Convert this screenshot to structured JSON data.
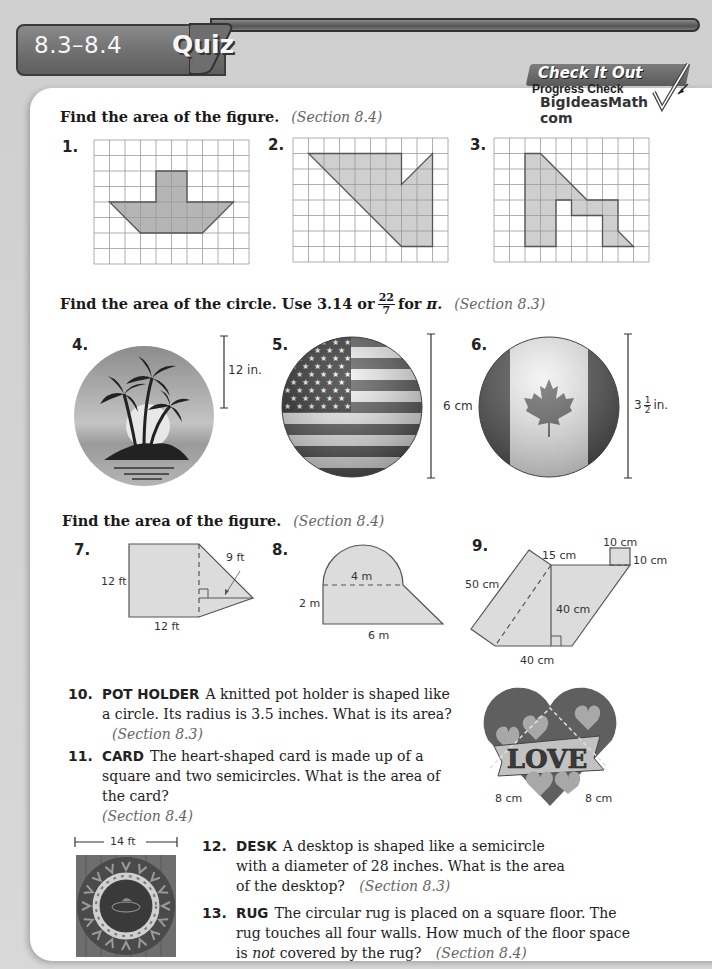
{
  "header": {
    "sections": "8.3–8.4",
    "title": "Quiz"
  },
  "badge": {
    "title": "Check It Out",
    "subtitle": "Progress Check",
    "site": "BigIdeasMath",
    "site_suffix": "com"
  },
  "part1": {
    "instruction": "Find the area of the figure.",
    "section": "(Section 8.4)",
    "figures": [
      {
        "number": "1.",
        "grid": {
          "cols": 10,
          "rows": 8
        },
        "shape": [
          [
            4,
            2
          ],
          [
            6,
            2
          ],
          [
            6,
            4
          ],
          [
            9,
            4
          ],
          [
            7,
            6
          ],
          [
            3,
            6
          ],
          [
            1,
            4
          ],
          [
            4,
            4
          ]
        ]
      },
      {
        "number": "2.",
        "grid": {
          "cols": 10,
          "rows": 8
        },
        "shape": [
          [
            1,
            1
          ],
          [
            7,
            1
          ],
          [
            7,
            3
          ],
          [
            9,
            1
          ],
          [
            9,
            7
          ],
          [
            7,
            7
          ]
        ]
      },
      {
        "number": "3.",
        "grid": {
          "cols": 10,
          "rows": 8
        },
        "shape": [
          [
            2,
            1
          ],
          [
            3,
            1
          ],
          [
            6,
            4
          ],
          [
            8,
            4
          ],
          [
            8,
            6
          ],
          [
            9,
            7
          ],
          [
            7,
            7
          ],
          [
            7,
            5
          ],
          [
            5,
            5
          ],
          [
            5,
            4
          ],
          [
            4,
            4
          ],
          [
            4,
            7
          ],
          [
            2,
            7
          ]
        ]
      }
    ]
  },
  "part2": {
    "instruction_a": "Find the area of the circle. Use 3.14 or",
    "pi_fraction": {
      "numerator": "22",
      "denominator": "7"
    },
    "instruction_b": "for",
    "pi_symbol": "π.",
    "section": "(Section 8.3)",
    "figures": [
      {
        "number": "4.",
        "image": "palm-island-circle",
        "measure": "radius",
        "label": "12 in."
      },
      {
        "number": "5.",
        "image": "us-flag-button",
        "measure": "diameter",
        "label": "6 cm"
      },
      {
        "number": "6.",
        "image": "canada-flag-button",
        "measure": "diameter",
        "label_whole": "3",
        "label_num": "1",
        "label_den": "2",
        "label_unit": "in."
      }
    ]
  },
  "part3": {
    "instruction": "Find the area of the figure.",
    "section": "(Section 8.4)",
    "figures": [
      {
        "number": "7.",
        "labels": {
          "side": "12 ft",
          "bottom": "12 ft",
          "height": "9 ft"
        }
      },
      {
        "number": "8.",
        "labels": {
          "diameter": "4 m",
          "side": "2 m",
          "bottom": "6 m"
        }
      },
      {
        "number": "9.",
        "labels": {
          "top_small": "10 cm",
          "right_small": "10 cm",
          "slant_top": "15 cm",
          "left": "50 cm",
          "height": "40 cm",
          "bottom": "40 cm"
        }
      }
    ]
  },
  "problems": [
    {
      "number": "10.",
      "keyword": "POT HOLDER",
      "text": "A knitted pot holder is shaped like a circle. Its radius is 3.5 inches. What is its area?",
      "section": "(Section 8.3)"
    },
    {
      "number": "11.",
      "keyword": "CARD",
      "text": "The heart-shaped card is made up of a square and two semicircles. What is the area of the card?",
      "section": "(Section 8.4)"
    },
    {
      "number": "12.",
      "keyword": "DESK",
      "text": "A desktop is shaped like a semicircle with a diameter of 28 inches. What is the area of the desktop?",
      "section": "(Section 8.3)"
    },
    {
      "number": "13.",
      "keyword": "RUG",
      "text_a": "The circular rug is placed on a square floor. The rug touches all four walls. How much of the floor space is",
      "text_em": "not",
      "text_b": "covered by the rug?",
      "section": "(Section 8.4)"
    }
  ],
  "heart_card": {
    "word": "LOVE",
    "left_label": "8 cm",
    "right_label": "8 cm"
  },
  "rug": {
    "label": "14 ft"
  }
}
